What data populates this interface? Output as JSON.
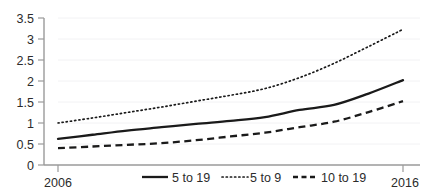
{
  "chart_data": {
    "type": "line",
    "title": "",
    "xlabel": "",
    "ylabel": "",
    "x": [
      2006,
      2007,
      2008,
      2009,
      2010,
      2011,
      2012,
      2013,
      2014,
      2015,
      2016
    ],
    "xlim": [
      2006,
      2016
    ],
    "ylim": [
      0,
      3.5
    ],
    "grid": true,
    "legend_position": "bottom",
    "xtick_labels": [
      "2006",
      "2016"
    ],
    "ytick_labels": [
      "0",
      "0.5",
      "1",
      "1.5",
      "2",
      "2.5",
      "3",
      "3.5"
    ],
    "ytick_values": [
      0,
      0.5,
      1,
      1.5,
      2,
      2.5,
      3,
      3.5
    ],
    "series": [
      {
        "name": "5 to 19",
        "style": "solid",
        "color": "#1a1a1a",
        "values": [
          0.62,
          0.72,
          0.82,
          0.9,
          0.98,
          1.05,
          1.14,
          1.31,
          1.43,
          1.7,
          2.02
        ]
      },
      {
        "name": "5 to 9",
        "style": "dotted",
        "color": "#1a1a1a",
        "values": [
          1.0,
          1.12,
          1.25,
          1.38,
          1.52,
          1.66,
          1.82,
          2.08,
          2.42,
          2.82,
          3.23
        ]
      },
      {
        "name": "10 to 19",
        "style": "dashed",
        "color": "#1a1a1a",
        "values": [
          0.4,
          0.44,
          0.48,
          0.52,
          0.59,
          0.68,
          0.77,
          0.9,
          1.03,
          1.26,
          1.52
        ]
      }
    ]
  },
  "axis": {
    "y_ticks": [
      {
        "label": "3.5",
        "value": 3.5
      },
      {
        "label": "3",
        "value": 3
      },
      {
        "label": "2.5",
        "value": 2.5
      },
      {
        "label": "2",
        "value": 2
      },
      {
        "label": "1.5",
        "value": 1.5
      },
      {
        "label": "1",
        "value": 1
      },
      {
        "label": "0.5",
        "value": 0.5
      },
      {
        "label": "0",
        "value": 0
      }
    ],
    "x_ticks": [
      {
        "label": "2006",
        "value": 2006
      },
      {
        "label": "2016",
        "value": 2016
      }
    ]
  },
  "legend": {
    "items": [
      {
        "label": "5 to 19",
        "style": "solid"
      },
      {
        "label": "5 to 9",
        "style": "dotted"
      },
      {
        "label": "10 to 19",
        "style": "dashed"
      }
    ]
  },
  "colors": {
    "line": "#1a1a1a",
    "axis": "#8a8a8a",
    "grid": "#f0f0f2",
    "text": "#2b2b2b",
    "background": "#ffffff"
  }
}
